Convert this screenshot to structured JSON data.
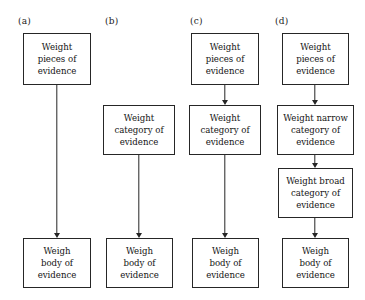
{
  "figure": {
    "background_color": "#ffffff",
    "line_color": "#262626",
    "text_color": "#141414"
  },
  "panels": [
    {
      "label": "(a)",
      "label_x": 18,
      "label_y": 16,
      "nodes": [
        {
          "id": "a-pieces",
          "text": "Weight\npieces of\nevidence",
          "x": 23,
          "y": 33,
          "width": 68,
          "height": 52
        },
        {
          "id": "a-body",
          "text": "Weigh\nbody of\nevidence",
          "x": 23,
          "y": 238,
          "width": 68,
          "height": 50
        }
      ],
      "arrows": [
        {
          "id": "a-arrow-1",
          "x": 57,
          "y_start": 85,
          "y_end": 238
        }
      ]
    },
    {
      "label": "(b)",
      "label_x": 105,
      "label_y": 16,
      "nodes": [
        {
          "id": "b-category",
          "text": "Weight\ncategory of\nevidence",
          "x": 103,
          "y": 105,
          "width": 72,
          "height": 50
        },
        {
          "id": "b-body",
          "text": "Weigh\nbody of\nevidence",
          "x": 106,
          "y": 238,
          "width": 67,
          "height": 50
        }
      ],
      "arrows": [
        {
          "id": "b-arrow-1",
          "x": 139,
          "y_start": 155,
          "y_end": 238
        }
      ]
    },
    {
      "label": "(c)",
      "label_x": 190,
      "label_y": 16,
      "nodes": [
        {
          "id": "c-pieces",
          "text": "Weight\npieces of\nevidence",
          "x": 191,
          "y": 33,
          "width": 68,
          "height": 52
        },
        {
          "id": "c-category",
          "text": "Weight\ncategory of\nevidence",
          "x": 189,
          "y": 105,
          "width": 72,
          "height": 50
        },
        {
          "id": "c-body",
          "text": "Weigh\nbody of\nevidence",
          "x": 192,
          "y": 238,
          "width": 67,
          "height": 50
        }
      ],
      "arrows": [
        {
          "id": "c-arrow-1",
          "x": 225,
          "y_start": 85,
          "y_end": 105
        },
        {
          "id": "c-arrow-2",
          "x": 225,
          "y_start": 155,
          "y_end": 238
        }
      ]
    },
    {
      "label": "(d)",
      "label_x": 275,
      "label_y": 16,
      "nodes": [
        {
          "id": "d-pieces",
          "text": "Weight\npieces of\nevidence",
          "x": 282,
          "y": 33,
          "width": 67,
          "height": 52
        },
        {
          "id": "d-narrow",
          "text": "Weight narrow\ncategory of\nevidence",
          "x": 277,
          "y": 105,
          "width": 77,
          "height": 50
        },
        {
          "id": "d-broad",
          "text": "Weight broad\ncategory of\nevidence",
          "x": 278,
          "y": 168,
          "width": 75,
          "height": 50
        },
        {
          "id": "d-body",
          "text": "Weigh\nbody of\nevidence",
          "x": 282,
          "y": 238,
          "width": 67,
          "height": 50
        }
      ],
      "arrows": [
        {
          "id": "d-arrow-1",
          "x": 315,
          "y_start": 85,
          "y_end": 105
        },
        {
          "id": "d-arrow-2",
          "x": 315,
          "y_start": 155,
          "y_end": 168
        },
        {
          "id": "d-arrow-3",
          "x": 315,
          "y_start": 218,
          "y_end": 238
        }
      ]
    }
  ]
}
